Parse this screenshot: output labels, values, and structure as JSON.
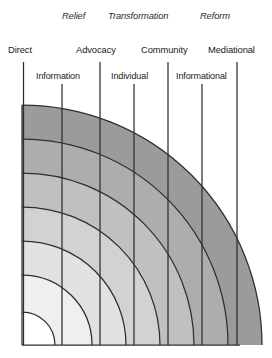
{
  "figure": {
    "categories": [
      {
        "label": "Relief",
        "x": 62,
        "y": 12
      },
      {
        "label": "Transformation",
        "x": 108,
        "y": 12
      },
      {
        "label": "Reform",
        "x": 200,
        "y": 12
      }
    ],
    "tier1_labels": [
      {
        "label": "Direct",
        "x": 8,
        "y": 45
      },
      {
        "label": "Advocacy",
        "x": 76,
        "y": 45
      },
      {
        "label": "Community",
        "x": 141,
        "y": 45
      },
      {
        "label": "Mediational",
        "x": 208,
        "y": 45
      }
    ],
    "tier2_labels": [
      {
        "label": "Information",
        "x": 36,
        "y": 72
      },
      {
        "label": "Individual",
        "x": 111,
        "y": 72
      },
      {
        "label": "Informational",
        "x": 176,
        "y": 72
      }
    ],
    "divider_lines": [
      {
        "name": "divider-direct",
        "x": 23.5,
        "y1": 62,
        "y2": 345
      },
      {
        "name": "divider-information",
        "x": 62,
        "y1": 84,
        "y2": 345
      },
      {
        "name": "divider-advocacy",
        "x": 100,
        "y1": 62,
        "y2": 345
      },
      {
        "name": "divider-individual",
        "x": 134,
        "y1": 84,
        "y2": 345
      },
      {
        "name": "divider-community",
        "x": 168,
        "y1": 62,
        "y2": 345
      },
      {
        "name": "divider-informational",
        "x": 202,
        "y1": 84,
        "y2": 345
      },
      {
        "name": "divider-mediational",
        "x": 237,
        "y1": 62,
        "y2": 345
      }
    ],
    "arc": {
      "center_x": 22,
      "center_y": 345,
      "radii": [
        33,
        70,
        104,
        138,
        172,
        206,
        240
      ],
      "band_fills": [
        "#ffffff",
        "#efefef",
        "#e2e2e2",
        "#d2d2d2",
        "#c0c0c0",
        "#adadad",
        "#9b9b9b"
      ],
      "stroke": "#2e2e2e",
      "stroke_width": 1.25
    },
    "frame": {
      "left_x": 22,
      "bottom_y": 345,
      "top_y": 112,
      "right_x": 240
    }
  }
}
